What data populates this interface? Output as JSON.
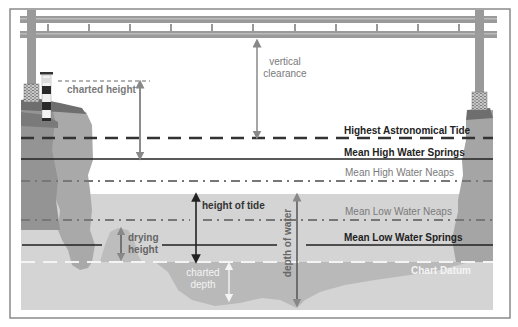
{
  "colors": {
    "frame": "#8a8a8a",
    "background": "#ffffff",
    "water": "#d4d4d4",
    "seabed": "#b8b8b8",
    "cliff_light": "#a6a6a6",
    "cliff_dark": "#8e8e8e",
    "bridge": "#9a9a9a",
    "dark_text": "#222222",
    "mid_text": "#777777",
    "light_text": "#f4f4f4"
  },
  "levels": {
    "hat": {
      "label": "Highest Astronomical Tide",
      "style": "long-dash",
      "color": "#333333"
    },
    "mhws": {
      "label": "Mean High Water Springs",
      "style": "solid",
      "color": "#222222"
    },
    "mhwn": {
      "label": "Mean High Water Neaps",
      "style": "dash-dot",
      "color": "#777777"
    },
    "mlwn": {
      "label": "Mean Low Water Neaps",
      "style": "dash-dot",
      "color": "#777777"
    },
    "mlws": {
      "label": "Mean Low Water Springs",
      "style": "solid",
      "color": "#222222"
    },
    "cd": {
      "label": "Chart Datum",
      "style": "dash",
      "color": "#f4f4f4"
    }
  },
  "measurements": {
    "vertical_clearance": {
      "line1": "vertical",
      "line2": "clearance"
    },
    "charted_height": {
      "label": "charted height"
    },
    "height_of_tide": {
      "label": "height of tide"
    },
    "drying_height": {
      "line1": "drying",
      "line2": "height"
    },
    "charted_depth": {
      "line1": "charted",
      "line2": "depth"
    },
    "depth_of_water": {
      "label": "depth of water"
    }
  }
}
